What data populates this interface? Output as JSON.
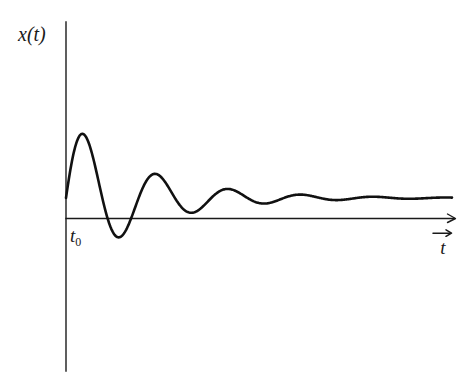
{
  "figure": {
    "background_color": "#ffffff",
    "ink_color": "#111111",
    "width": 466,
    "height": 385
  },
  "axes": {
    "y_axis": {
      "label": "x(t)",
      "x_px": 66,
      "top_px": 22,
      "bottom_px": 371,
      "has_arrow": false
    },
    "x_axis": {
      "label": "t",
      "label_has_overhead_arrow": true,
      "arrow_icon": "right-arrow-icon",
      "y_px": 218,
      "left_px": 66,
      "right_px": 455,
      "has_arrow": true
    },
    "origin_label": "t",
    "origin_label_subscript": "0"
  },
  "chart_data": {
    "type": "line",
    "xlabel": "t",
    "ylabel": "x(t)",
    "grid": false,
    "legend": null,
    "annotations": [
      {
        "text": "t_0",
        "note": "start time marked at origin on the t-axis"
      }
    ],
    "axis_units": "arbitrary",
    "xlim": [
      0,
      10
    ],
    "ylim": [
      -1.2,
      1.2
    ],
    "model": {
      "form": "x(t) = A * exp(-lambda * (t - t0)) * sin(omega * (t - t0))",
      "A": 1.08,
      "lambda": 0.52,
      "omega": 3.34,
      "t0": 0.0
    },
    "features": {
      "zero_crossings_t": [
        0.0,
        1.88,
        2.82,
        3.76,
        4.7,
        5.64,
        6.58,
        7.52,
        8.46
      ],
      "extrema": [
        {
          "kind": "peak",
          "index": 1,
          "t": 0.42,
          "value": 1.0
        },
        {
          "kind": "trough",
          "index": 1,
          "t": 1.64,
          "value": -0.65
        },
        {
          "kind": "peak",
          "index": 2,
          "t": 2.42,
          "value": 0.27
        },
        {
          "kind": "trough",
          "index": 2,
          "t": 3.32,
          "value": -0.21
        },
        {
          "kind": "peak",
          "index": 3,
          "t": 4.28,
          "value": 0.12
        },
        {
          "kind": "trough",
          "index": 3,
          "t": 5.1,
          "value": -0.09
        },
        {
          "kind": "peak",
          "index": 4,
          "t": 6.08,
          "value": 0.05
        },
        {
          "kind": "trough",
          "index": 4,
          "t": 6.98,
          "value": -0.035
        }
      ]
    },
    "series": [
      {
        "name": "x(t)",
        "color": "#111111",
        "x": [
          0.0,
          0.1,
          0.2,
          0.3,
          0.42,
          0.55,
          0.7,
          0.85,
          1.0,
          1.2,
          1.4,
          1.64,
          1.88,
          2.1,
          2.42,
          2.6,
          2.82,
          3.05,
          3.32,
          3.55,
          3.76,
          4.0,
          4.28,
          4.5,
          4.7,
          4.9,
          5.1,
          5.4,
          5.64,
          5.85,
          6.08,
          6.3,
          6.58,
          6.8,
          6.98,
          7.2,
          7.52,
          7.9,
          8.46,
          9.0,
          9.6,
          10.0
        ],
        "y": [
          0.0,
          0.32,
          0.61,
          0.84,
          1.0,
          0.97,
          0.82,
          0.58,
          0.3,
          -0.12,
          -0.46,
          -0.65,
          0.0,
          0.18,
          0.27,
          0.24,
          0.0,
          -0.12,
          -0.21,
          -0.13,
          0.0,
          0.07,
          0.12,
          0.09,
          0.0,
          -0.05,
          -0.09,
          -0.05,
          0.0,
          0.03,
          0.05,
          0.04,
          0.0,
          -0.02,
          -0.035,
          -0.02,
          0.0,
          0.012,
          0.0,
          -0.004,
          0.0,
          0.0
        ]
      }
    ]
  }
}
